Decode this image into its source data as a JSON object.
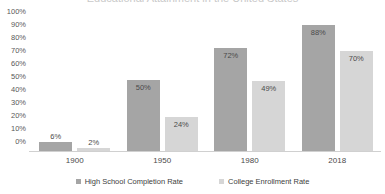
{
  "title_sliver": "Educational Attainment in the United States",
  "legend": {
    "position": "bottom-center",
    "items": [
      {
        "label": "High School Completion Rate",
        "color": "#a5a5a5",
        "marker": "square-swatch"
      },
      {
        "label": "College Enrollment Rate",
        "color": "#d6d6d6",
        "marker": "square-swatch"
      }
    ]
  },
  "axis": {
    "y_ticks": [
      "100%",
      "90%",
      "80%",
      "70%",
      "60%",
      "50%",
      "40%",
      "30%",
      "20%",
      "10%",
      "0%"
    ],
    "x_categories": [
      "1900",
      "1950",
      "1980",
      "2018"
    ]
  },
  "chart_data": {
    "type": "bar",
    "title": "",
    "xlabel": "",
    "ylabel": "",
    "ylim": [
      0,
      100
    ],
    "y_tick_step": 10,
    "grid": false,
    "legend_position": "bottom-center",
    "categories": [
      "1900",
      "1950",
      "1980",
      "2018"
    ],
    "series": [
      {
        "name": "High School Completion Rate",
        "color": "#a5a5a5",
        "values": [
          6,
          50,
          72,
          88
        ],
        "labels": [
          "6%",
          "50%",
          "72%",
          "88%"
        ]
      },
      {
        "name": "College Enrollment Rate",
        "color": "#d6d6d6",
        "values": [
          2,
          24,
          49,
          70
        ],
        "labels": [
          "2%",
          "24%",
          "49%",
          "70%"
        ]
      }
    ]
  }
}
